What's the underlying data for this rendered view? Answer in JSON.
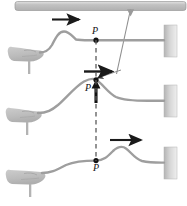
{
  "figure": {
    "colors": {
      "rope": "#9e9e9e",
      "hand": "#bdbdbd",
      "wall": "#c9c9c9",
      "ceiling": "#c4c4c4",
      "arrow": "#1a1a1a",
      "dashed_line": "#5a5a5a",
      "leader_line": "#8a8a8a",
      "label_text": "#111111",
      "background": "#ffffff"
    },
    "labels": {
      "point_top": "P",
      "point_middle": "P",
      "point_bottom": "P"
    },
    "elements": {
      "ceiling_bar": "ceiling-bar",
      "leader_line": "leader-line-from-ceiling-to-point-p",
      "dashed_vertical": "dashed-vertical-guide-line",
      "wave_direction_arrow": "wave-direction-arrow-right",
      "velocity_arrow_horizontal": "horizontal-velocity-arrow",
      "velocity_arrow_vertical": "vertical-velocity-arrow-up",
      "wall_right": "fixed-end-wall-block",
      "hand": "hand-holding-rope",
      "rope": "rope-with-pulse"
    },
    "rows": [
      {
        "index": 1,
        "name": "snapshot-top",
        "arrow_direction": "right",
        "point_label": "P",
        "pulse_position": "left-of-P",
        "has_point_marker": true
      },
      {
        "index": 2,
        "name": "snapshot-middle",
        "arrow_direction": "right-and-up",
        "point_label": "P",
        "pulse_position": "crest-at-P",
        "has_point_marker": true
      },
      {
        "index": 3,
        "name": "snapshot-bottom",
        "arrow_direction": "right",
        "point_label": "P",
        "pulse_position": "right-of-P",
        "has_point_marker": true
      }
    ]
  }
}
